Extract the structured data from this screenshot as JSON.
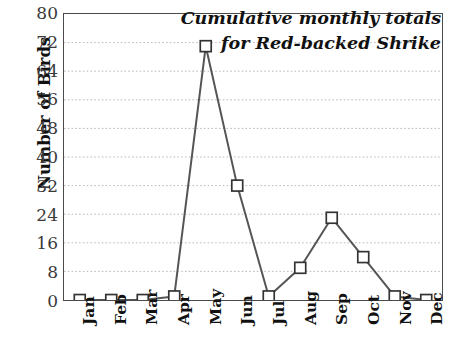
{
  "chart_data": {
    "type": "line",
    "title": "Cumulative monthly totals for Red-backed Shrike",
    "title_line1": "Cumulative monthly totals",
    "title_line2": "for Red-backed Shrike",
    "xlabel": "",
    "ylabel": "Number of Birds",
    "categories": [
      "Jan",
      "Feb",
      "Mar",
      "Apr",
      "May",
      "Jun",
      "Jul",
      "Aug",
      "Sep",
      "Oct",
      "Nov",
      "Dec"
    ],
    "values": [
      0,
      0,
      0,
      1,
      71,
      32,
      1,
      9,
      23,
      12,
      1,
      0
    ],
    "ylim": [
      0,
      80
    ],
    "ytick_labels": [
      "0",
      "8",
      "16",
      "24",
      "32",
      "40",
      "48",
      "56",
      "64",
      "72",
      "80"
    ],
    "ytick_values": [
      0,
      8,
      16,
      24,
      32,
      40,
      48,
      56,
      64,
      72,
      80
    ],
    "grid": "horizontal-dotted",
    "legend": "none",
    "series": [
      {
        "name": "Red-backed Shrike cumulative monthly total",
        "values": [
          0,
          0,
          0,
          1,
          71,
          32,
          1,
          9,
          23,
          12,
          1,
          0
        ],
        "marker": "open-square",
        "line_color": "#555555",
        "marker_fill": "#ffffff",
        "marker_edge": "#333333"
      }
    ],
    "colors": {
      "line": "#555555",
      "marker_fill": "#ffffff",
      "marker_edge": "#333333",
      "grid": "#b8b8b8",
      "axis": "#4a4a4a",
      "text": "#111111",
      "tick_text": "#3a3a3a",
      "background": "#ffffff"
    }
  }
}
